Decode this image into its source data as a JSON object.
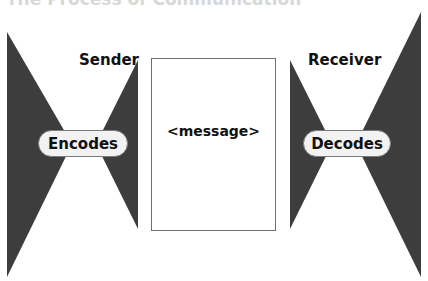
{
  "diagram": {
    "title": "The Process of Communication",
    "sender": {
      "label": "Sender",
      "action": "Encodes"
    },
    "message": {
      "label": "<message>"
    },
    "receiver": {
      "label": "Receiver",
      "action": "Decodes"
    },
    "colors": {
      "shape_fill": "#3d3d3d",
      "pill_fill": "#f2f2f2",
      "pill_border": "#7a7a7a",
      "box_border": "#6f6f6f",
      "text": "#111111"
    }
  }
}
